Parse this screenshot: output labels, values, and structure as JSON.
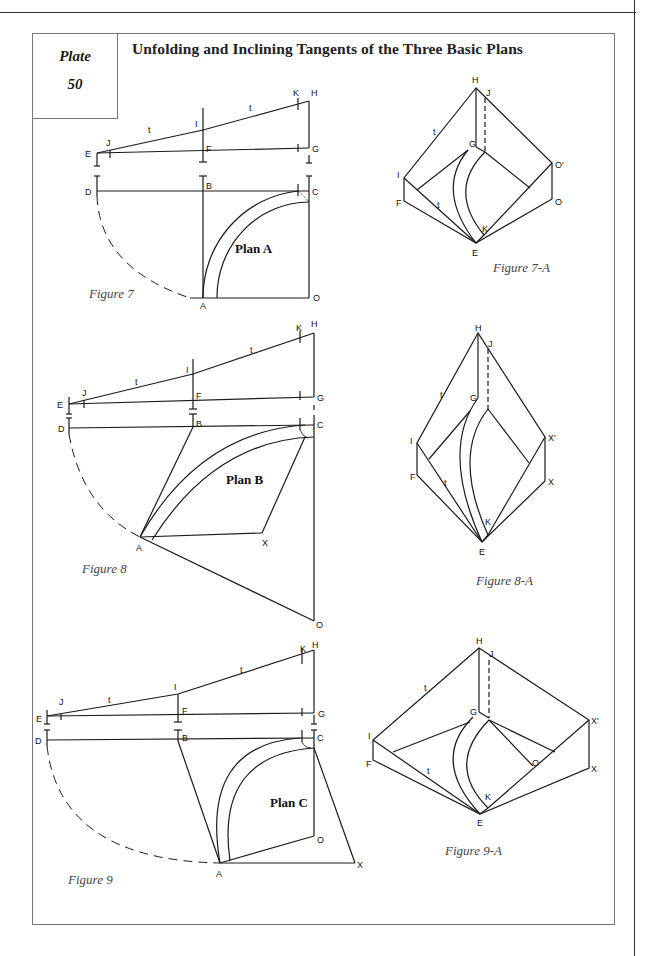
{
  "plate": {
    "label": "Plate",
    "number": "50"
  },
  "title": "Unfolding and Inclining Tangents of the Three Basic Plans",
  "figures": [
    {
      "id": "figure-7",
      "caption": "Figure 7",
      "plan_label": "Plan A",
      "points": [
        "E",
        "J",
        "I",
        "F",
        "K",
        "H",
        "G",
        "D",
        "B",
        "C",
        "A",
        "O"
      ],
      "tangent_label": "t"
    },
    {
      "id": "figure-7a",
      "caption": "Figure 7-A",
      "points": [
        "H",
        "J",
        "G",
        "I",
        "F",
        "O'",
        "O",
        "K",
        "E"
      ],
      "tangent_label": "t"
    },
    {
      "id": "figure-8",
      "caption": "Figure 8",
      "plan_label": "Plan B",
      "points": [
        "E",
        "J",
        "I",
        "F",
        "K",
        "H",
        "G",
        "D",
        "B",
        "C",
        "A",
        "X",
        "O"
      ],
      "tangent_label": "t"
    },
    {
      "id": "figure-8a",
      "caption": "Figure 8-A",
      "points": [
        "H",
        "J",
        "G",
        "I",
        "F",
        "X'",
        "X",
        "K",
        "E"
      ],
      "tangent_label": "t"
    },
    {
      "id": "figure-9",
      "caption": "Figure 9",
      "plan_label": "Plan C",
      "points": [
        "E",
        "J",
        "I",
        "F",
        "K",
        "H",
        "G",
        "D",
        "B",
        "C",
        "O",
        "A",
        "X"
      ],
      "tangent_label": "t"
    },
    {
      "id": "figure-9a",
      "caption": "Figure 9-A",
      "points": [
        "H",
        "J",
        "G",
        "I",
        "F",
        "O",
        "X'",
        "X",
        "K",
        "E"
      ],
      "tangent_label": "t"
    }
  ],
  "labels": {
    "E": "E",
    "J": "J",
    "I": "I",
    "F": "F",
    "K": "K",
    "H": "H",
    "G": "G",
    "D": "D",
    "B": "B",
    "C": "C",
    "A": "A",
    "O": "O",
    "X": "X",
    "Xp": "X'",
    "Op": "O'",
    "t": "t"
  }
}
